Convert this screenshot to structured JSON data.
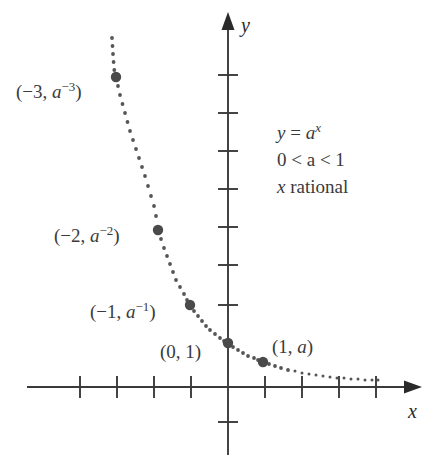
{
  "figure": {
    "background_color": "#ffffff",
    "ink_color": "#3a3a3a",
    "curve_color": "#555555",
    "point_color": "#4a4a4a"
  },
  "axes": {
    "x_label": "x",
    "y_label": "y",
    "x_axis_y_px": 387,
    "y_axis_x_px": 228,
    "x_tick_spacing_px": 37,
    "y_tick_spacing_px": 38,
    "x_ticks_left": 4,
    "x_ticks_right": 4,
    "y_ticks_up": 8,
    "y_ticks_down": 1,
    "x_arrow": true,
    "y_arrow": true,
    "grid": false
  },
  "annotation": {
    "line1_lhs": "y",
    "line1_eq": " = ",
    "line1_base": "a",
    "line1_exp": "x",
    "line2": "0 < a < 1",
    "line3_var": "x",
    "line3_text": " rational"
  },
  "point_labels": [
    {
      "text_open": "(−3, ",
      "base": "a",
      "exp": "−3",
      "text_close": ")",
      "x_px": 16,
      "y_px": 82
    },
    {
      "text_open": "(−2, ",
      "base": "a",
      "exp": "−2",
      "text_close": ")",
      "x_px": 54,
      "y_px": 226
    },
    {
      "text_open": "(−1, ",
      "base": "a",
      "exp": "−1",
      "text_close": ")",
      "x_px": 90,
      "y_px": 302
    },
    {
      "text_open": "(0, 1)",
      "base": "",
      "exp": "",
      "text_close": "",
      "x_px": 160,
      "y_px": 342
    },
    {
      "text_open": "(1, ",
      "base": "a",
      "exp": "",
      "text_close": ")",
      "x_px": 272,
      "y_px": 337
    }
  ],
  "chart_data": {
    "type": "scatter",
    "title": "",
    "xlabel": "x",
    "ylabel": "y",
    "curve_equation": "y = a^x",
    "parameter_constraint": "0 < a < 1",
    "domain_note": "x rational",
    "line_style": "dotted",
    "xlim": [
      -5.4,
      5.2
    ],
    "ylim": [
      -0.9,
      9.2
    ],
    "marked_points": [
      {
        "label": "(−3, a⁻³)",
        "x": -3,
        "y": 8.1,
        "px": 116,
        "py": 77
      },
      {
        "label": "(−2, a⁻²)",
        "x": -2,
        "y": 4.1,
        "px": 158,
        "py": 230
      },
      {
        "label": "(−1, a⁻¹)",
        "x": -1,
        "y": 2.1,
        "px": 190,
        "py": 305
      },
      {
        "label": "(0, 1)",
        "x": 0,
        "y": 1,
        "px": 228,
        "py": 343
      },
      {
        "label": "(1, a)",
        "x": 1,
        "y": 0.65,
        "px": 263,
        "py": 362
      }
    ],
    "curve_points_px": [
      [
        112,
        38
      ],
      [
        112.5,
        46
      ],
      [
        113,
        54
      ],
      [
        113.6,
        62
      ],
      [
        114.3,
        70
      ],
      [
        116,
        77
      ],
      [
        118,
        86
      ],
      [
        120,
        95
      ],
      [
        122.5,
        104
      ],
      [
        125,
        113
      ],
      [
        127.5,
        122
      ],
      [
        130,
        131
      ],
      [
        133,
        140
      ],
      [
        136,
        149
      ],
      [
        139,
        158
      ],
      [
        142,
        167
      ],
      [
        145,
        176
      ],
      [
        148,
        186
      ],
      [
        151,
        196
      ],
      [
        154,
        206
      ],
      [
        156,
        216
      ],
      [
        158,
        230
      ],
      [
        161,
        239
      ],
      [
        164,
        248
      ],
      [
        167,
        256
      ],
      [
        170,
        264
      ],
      [
        173,
        272
      ],
      [
        176,
        280
      ],
      [
        180,
        287
      ],
      [
        184,
        294
      ],
      [
        187,
        300
      ],
      [
        190,
        305
      ],
      [
        194,
        311
      ],
      [
        198,
        316
      ],
      [
        202,
        321
      ],
      [
        206,
        326
      ],
      [
        210,
        330
      ],
      [
        215,
        334
      ],
      [
        220,
        338
      ],
      [
        224,
        341
      ],
      [
        228,
        343
      ],
      [
        233,
        347
      ],
      [
        238,
        350
      ],
      [
        243,
        353
      ],
      [
        248,
        356
      ],
      [
        254,
        358
      ],
      [
        258,
        360
      ],
      [
        263,
        362
      ],
      [
        269,
        364
      ],
      [
        275,
        366
      ],
      [
        281,
        368
      ],
      [
        288,
        370
      ],
      [
        295,
        371
      ],
      [
        302,
        373
      ],
      [
        309,
        374
      ],
      [
        316,
        375
      ],
      [
        323,
        376
      ],
      [
        330,
        377
      ],
      [
        337,
        378
      ],
      [
        344,
        378
      ],
      [
        351,
        379
      ],
      [
        358,
        379
      ],
      [
        365,
        380
      ],
      [
        372,
        380
      ],
      [
        378,
        380
      ]
    ]
  }
}
